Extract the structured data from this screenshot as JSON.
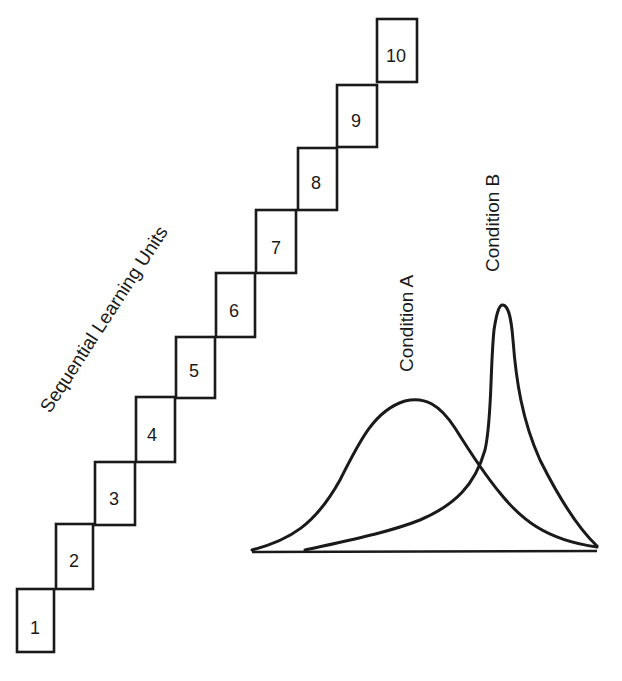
{
  "diagram": {
    "staircase": {
      "title": "Sequential Learning Units",
      "units": [
        {
          "label": "1",
          "x": 17,
          "y": 589,
          "w": 37,
          "h": 63
        },
        {
          "label": "2",
          "x": 56,
          "y": 524,
          "w": 37,
          "h": 65
        },
        {
          "label": "3",
          "x": 95,
          "y": 462,
          "w": 40,
          "h": 63
        },
        {
          "label": "4",
          "x": 136,
          "y": 397,
          "w": 39,
          "h": 65
        },
        {
          "label": "5",
          "x": 176,
          "y": 337,
          "w": 39,
          "h": 61
        },
        {
          "label": "6",
          "x": 216,
          "y": 273,
          "w": 39,
          "h": 64
        },
        {
          "label": "7",
          "x": 256,
          "y": 210,
          "w": 40,
          "h": 63
        },
        {
          "label": "8",
          "x": 298,
          "y": 148,
          "w": 39,
          "h": 62
        },
        {
          "label": "9",
          "x": 337,
          "y": 85,
          "w": 40,
          "h": 62
        },
        {
          "label": "10",
          "x": 377,
          "y": 19,
          "w": 40,
          "h": 63
        }
      ]
    },
    "distributions": {
      "curves": [
        {
          "name": "Condition A",
          "shape": "broad, peaked left-center",
          "peak_x": 415,
          "peak_y": 399
        },
        {
          "name": "Condition B",
          "shape": "narrow, tall, peaked right",
          "peak_x": 502,
          "peak_y": 305
        }
      ],
      "labels": {
        "condition_a": "Condition A",
        "condition_b": "Condition B"
      },
      "axis": {
        "x1": 252,
        "x2": 597,
        "y": 552
      }
    },
    "colors": {
      "ink": "#1a1a1a",
      "paper": "#ffffff"
    }
  }
}
